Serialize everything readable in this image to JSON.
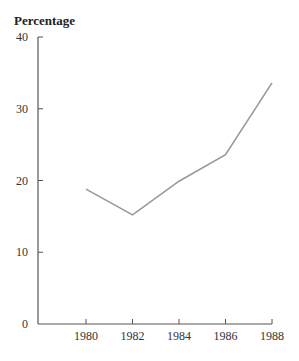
{
  "chart_data": {
    "type": "line",
    "title": "",
    "xlabel": "",
    "ylabel": "Percentage",
    "x": [
      1980,
      1982,
      1984,
      1986,
      1988
    ],
    "categories": [
      "1980",
      "1982",
      "1984",
      "1986",
      "1988"
    ],
    "series": [
      {
        "name": "Percentage",
        "values": [
          18.8,
          15.2,
          19.9,
          23.6,
          33.6
        ],
        "color": "#999999"
      }
    ],
    "yticks": [
      0,
      10,
      20,
      30,
      40
    ],
    "xticks": [
      "1980",
      "1982",
      "1984",
      "1986",
      "1988"
    ],
    "ylim": [
      0,
      40
    ],
    "grid": false,
    "legend": null
  }
}
